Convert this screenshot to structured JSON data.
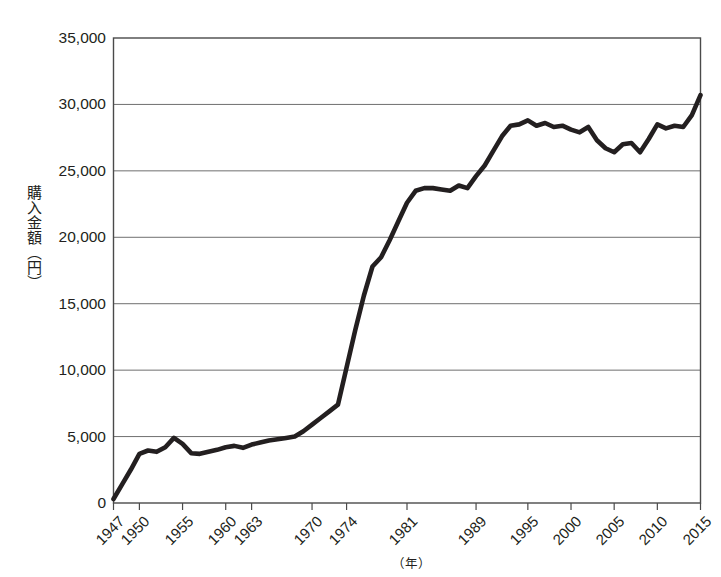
{
  "chart_data": {
    "type": "line",
    "title": "",
    "xlabel": "（年）",
    "ylabel": "購入金額（円）",
    "ylim": [
      0,
      35000
    ],
    "xlim": [
      1947,
      2015
    ],
    "grid": true,
    "legend": false,
    "y_ticks": [
      0,
      5000,
      10000,
      15000,
      20000,
      25000,
      30000,
      35000
    ],
    "y_tick_labels": [
      "0",
      "5,000",
      "10,000",
      "15,000",
      "20,000",
      "25,000",
      "30,000",
      "35,000"
    ],
    "x_ticks": [
      1947,
      1950,
      1955,
      1960,
      1963,
      1970,
      1974,
      1981,
      1989,
      1995,
      2000,
      2005,
      2010,
      2015
    ],
    "x_tick_labels": [
      "1947",
      "1950",
      "1955",
      "1960",
      "1963",
      "1970",
      "1974",
      "1981",
      "1989",
      "1995",
      "2000",
      "2005",
      "2010",
      "2015"
    ],
    "series": [
      {
        "name": "購入金額",
        "color": "#231f20",
        "x": [
          1947,
          1948,
          1949,
          1950,
          1951,
          1952,
          1953,
          1954,
          1955,
          1956,
          1957,
          1958,
          1959,
          1960,
          1961,
          1962,
          1963,
          1964,
          1965,
          1966,
          1967,
          1968,
          1969,
          1970,
          1971,
          1972,
          1973,
          1974,
          1975,
          1976,
          1977,
          1978,
          1979,
          1980,
          1981,
          1982,
          1983,
          1984,
          1985,
          1986,
          1987,
          1988,
          1989,
          1990,
          1991,
          1992,
          1993,
          1994,
          1995,
          1996,
          1997,
          1998,
          1999,
          2000,
          2001,
          2002,
          2003,
          2004,
          2005,
          2006,
          2007,
          2008,
          2009,
          2010,
          2011,
          2012,
          2013,
          2014,
          2015
        ],
        "y": [
          300,
          1400,
          2500,
          3700,
          3950,
          3850,
          4200,
          4900,
          4450,
          3750,
          3700,
          3850,
          4000,
          4200,
          4300,
          4150,
          4400,
          4550,
          4700,
          4800,
          4900,
          5000,
          5400,
          5900,
          6400,
          6900,
          7400,
          10200,
          13000,
          15600,
          17800,
          18500,
          19800,
          21200,
          22600,
          23500,
          23700,
          23700,
          23600,
          23500,
          23900,
          23700,
          24600,
          25400,
          26500,
          27600,
          28400,
          28500,
          28800,
          28400,
          28600,
          28300,
          28400,
          28100,
          27900,
          28300,
          27300,
          26700,
          26400,
          27000,
          27100,
          26400,
          27400,
          28500,
          28200,
          28400,
          28300,
          29200,
          30700
        ]
      }
    ]
  },
  "axis": {
    "y_label_text": "購入金額（円）",
    "x_unit_text": "（年）"
  }
}
